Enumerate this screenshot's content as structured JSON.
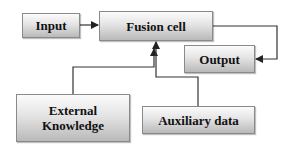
{
  "diagram": {
    "nodes": {
      "input": {
        "label": "Input"
      },
      "fusion": {
        "label": "Fusion cell"
      },
      "output": {
        "label": "Output"
      },
      "external": {
        "line1": "External",
        "line2": "Knowledge"
      },
      "auxiliary": {
        "label": "Auxiliary data"
      }
    },
    "edges": [
      {
        "from": "Input",
        "to": "Fusion cell"
      },
      {
        "from": "Fusion cell",
        "to": "Output"
      },
      {
        "from": "External Knowledge",
        "to": "Fusion cell"
      },
      {
        "from": "Auxiliary data",
        "to": "Fusion cell"
      }
    ],
    "colors": {
      "line": "#333333",
      "box_border": "#8a8a8a",
      "text": "#111111"
    }
  }
}
